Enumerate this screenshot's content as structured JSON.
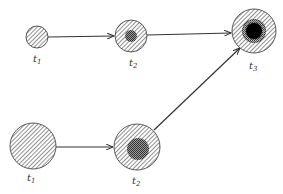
{
  "diagram": {
    "type": "growth-progression",
    "colors": {
      "stroke": "#333333",
      "hatch": "#555555",
      "stipple": "#444444",
      "core": "#000000",
      "background": "#ffffff"
    },
    "nodes": [
      {
        "id": "top-t1",
        "label": "t",
        "sub": "1",
        "cx": 37,
        "cy": 37,
        "r": 11,
        "inner": null
      },
      {
        "id": "top-t2",
        "label": "t",
        "sub": "2",
        "cx": 131,
        "cy": 36,
        "r": 16,
        "inner": {
          "r": 6,
          "fill": "stipple"
        }
      },
      {
        "id": "t3",
        "label": "t",
        "sub": "3",
        "cx": 254,
        "cy": 31,
        "r": 22,
        "inner": {
          "r": 12,
          "fill": "stipple",
          "core_r": 8
        }
      },
      {
        "id": "bottom-t1",
        "label": "t",
        "sub": "1",
        "cx": 33,
        "cy": 146,
        "r": 23,
        "inner": null
      },
      {
        "id": "bottom-t2",
        "label": "t",
        "sub": "2",
        "cx": 137,
        "cy": 147,
        "r": 23,
        "inner": {
          "r": 11,
          "fill": "stipple"
        }
      }
    ],
    "edges": [
      {
        "from": "top-t1",
        "to": "top-t2"
      },
      {
        "from": "top-t2",
        "to": "t3"
      },
      {
        "from": "bottom-t1",
        "to": "bottom-t2"
      },
      {
        "from": "bottom-t2",
        "to": "t3"
      }
    ],
    "labels": {
      "top_t1": {
        "main": "t",
        "sub": "1"
      },
      "top_t2": {
        "main": "t",
        "sub": "2"
      },
      "t3": {
        "main": "t",
        "sub": "3"
      },
      "bottom_t1": {
        "main": "t",
        "sub": "1"
      },
      "bottom_t2": {
        "main": "t",
        "sub": "2"
      }
    }
  }
}
